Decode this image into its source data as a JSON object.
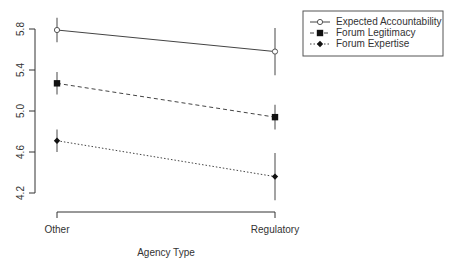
{
  "chart_data": {
    "type": "line",
    "title": "",
    "xlabel": "Agency Type",
    "ylabel": "",
    "categories": [
      "Other",
      "Regulatory"
    ],
    "ylim": [
      4.2,
      5.8
    ],
    "yticks": [
      "4.2",
      "4.6",
      "5.0",
      "5.4",
      "5.8"
    ],
    "grid": false,
    "legend_position": "top-right",
    "series": [
      {
        "name": "Expected Accountability",
        "values": [
          5.79,
          5.58
        ],
        "err": [
          0.12,
          0.23
        ],
        "line": "solid",
        "marker": "open-circle"
      },
      {
        "name": "Forum Legitimacy",
        "values": [
          5.27,
          4.94
        ],
        "err": [
          0.11,
          0.12
        ],
        "line": "dashed",
        "marker": "filled-square"
      },
      {
        "name": "Forum Expertise",
        "values": [
          4.71,
          4.36
        ],
        "err": [
          0.11,
          0.23
        ],
        "line": "dotted",
        "marker": "filled-diamond"
      }
    ]
  }
}
